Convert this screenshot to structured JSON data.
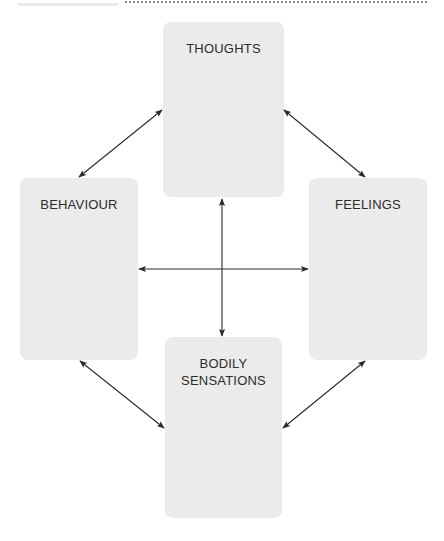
{
  "diagram": {
    "type": "cbt-cycle",
    "nodes": [
      {
        "id": "thoughts",
        "label": "THOUGHTS"
      },
      {
        "id": "behaviour",
        "label": "BEHAVIOUR"
      },
      {
        "id": "feelings",
        "label": "FEELINGS"
      },
      {
        "id": "bodily",
        "label_line1": "BODILY",
        "label_line2": "SENSATIONS"
      }
    ],
    "edges": [
      {
        "from": "thoughts",
        "to": "behaviour",
        "direction": "both"
      },
      {
        "from": "thoughts",
        "to": "feelings",
        "direction": "both"
      },
      {
        "from": "behaviour",
        "to": "bodily",
        "direction": "both"
      },
      {
        "from": "feelings",
        "to": "bodily",
        "direction": "both"
      },
      {
        "from": "thoughts",
        "to": "bodily",
        "direction": "both"
      },
      {
        "from": "behaviour",
        "to": "feelings",
        "direction": "both"
      }
    ],
    "colors": {
      "box_fill": "#ebebeb",
      "text": "#2b2b2b",
      "arrow": "#2a2a2a"
    }
  }
}
